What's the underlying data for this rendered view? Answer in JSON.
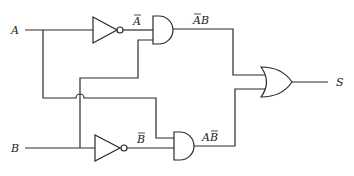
{
  "diagram": {
    "type": "logic-circuit",
    "inputs": [
      {
        "name": "A",
        "label": "A"
      },
      {
        "name": "B",
        "label": "B"
      }
    ],
    "output": {
      "name": "S",
      "label": "S"
    },
    "gates": [
      {
        "id": "not_a",
        "type": "NOT",
        "input": "A",
        "output_label": "A",
        "output_overbar": true
      },
      {
        "id": "not_b",
        "type": "NOT",
        "input": "B",
        "output_label": "B",
        "output_overbar": true
      },
      {
        "id": "and_1",
        "type": "AND",
        "inputs": [
          "Ā",
          "B"
        ],
        "output_label_parts": [
          "A",
          "B"
        ],
        "overbar_on": "A",
        "expression": "ĀB"
      },
      {
        "id": "and_2",
        "type": "AND",
        "inputs": [
          "A",
          "B̄"
        ],
        "output_label_parts": [
          "A",
          "B"
        ],
        "overbar_on": "B",
        "expression": "AB̄"
      },
      {
        "id": "or_1",
        "type": "OR",
        "inputs": [
          "ĀB",
          "AB̄"
        ],
        "output": "S"
      }
    ],
    "colors": {
      "line": "#2a2a2a",
      "background": "#ffffff"
    }
  }
}
